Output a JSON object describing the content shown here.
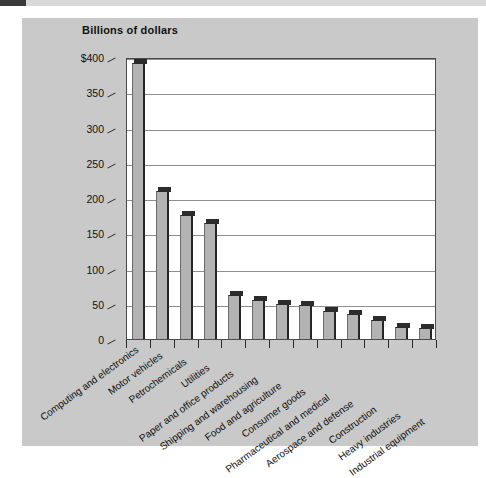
{
  "figure": {
    "title": "Billions of dollars"
  },
  "chart_data": {
    "type": "bar",
    "title": "Billions of dollars",
    "xlabel": "",
    "ylabel": "Billions of dollars",
    "ylim": [
      0,
      400
    ],
    "grid": true,
    "legend": "none",
    "ytick_labels": [
      "$400",
      "350",
      "300",
      "250",
      "200",
      "150",
      "100",
      "50",
      "0"
    ],
    "ytick_values": [
      400,
      350,
      300,
      250,
      200,
      150,
      100,
      50,
      0
    ],
    "categories": [
      "Computing and electronics",
      "Motor vehicles",
      "Petrochemicals",
      "Utilities",
      "Paper and office products",
      "Shipping and warehousing",
      "Food and agriculture",
      "Consumer goods",
      "Pharmaceutical and medical",
      "Aerospace and defense",
      "Construction",
      "Heavy industries",
      "Industrial equipment"
    ],
    "values": [
      392,
      210,
      176,
      165,
      62,
      55,
      50,
      48,
      40,
      35,
      27,
      17,
      16
    ],
    "colors": {
      "bar_face": "#b3b3b3",
      "bar_edge": "#262626",
      "plot_background": "#ffffff",
      "panel_background": "#c9c9c9",
      "gridline": "#8e8e8e"
    }
  }
}
